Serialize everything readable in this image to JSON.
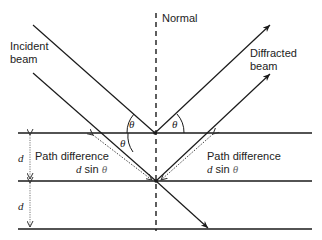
{
  "diagram": {
    "labels": {
      "normal": "Normal",
      "incident_line1": "Incident",
      "incident_line2": "beam",
      "diffracted_line1": "Diffracted",
      "diffracted_line2": "beam",
      "path_diff_left_line1": "Path difference",
      "path_diff_left_d": "d",
      "path_diff_left_rest": " sin ",
      "path_diff_left_theta": "θ",
      "path_diff_right_line1": "Path difference",
      "path_diff_right_d": "d",
      "path_diff_right_rest": " sin ",
      "path_diff_right_theta": "θ",
      "spacing_top": "d",
      "spacing_bottom": "d",
      "angle_incident": "θ",
      "angle_diffracted": "θ",
      "angle_inner": "θ"
    },
    "colors": {
      "line": "#1a1a1a",
      "dotted": "#555555",
      "background": "#ffffff"
    }
  }
}
